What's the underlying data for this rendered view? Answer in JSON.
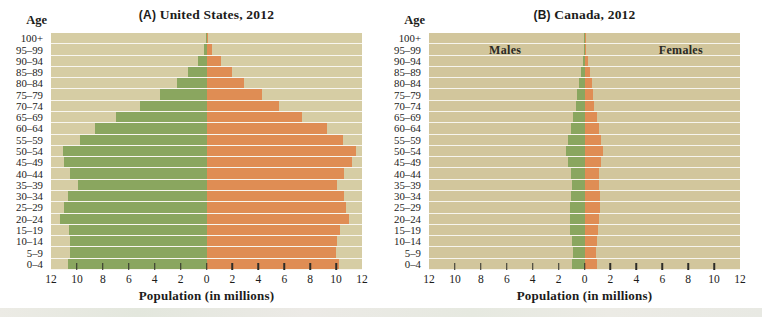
{
  "figure": {
    "age_header": "Age",
    "xlabel": "Population (in millions)",
    "tick_labels": [
      "12",
      "10",
      "8",
      "6",
      "4",
      "2",
      "0",
      "2",
      "4",
      "6",
      "8",
      "10",
      "12"
    ],
    "age_groups_top_to_bottom": [
      "100+",
      "95–99",
      "90–94",
      "85–89",
      "80–84",
      "75–79",
      "70–74",
      "65–69",
      "60–64",
      "55–59",
      "50–54",
      "45–49",
      "40–44",
      "35–39",
      "30–34",
      "25–29",
      "20–24",
      "15–19",
      "10–14",
      "5–9",
      "0–4"
    ],
    "colors": {
      "males_bar": "#8aa65f",
      "females_bar": "#df8d54",
      "panel_a_background": "#d6cda4",
      "panel_b_background": "#d2c69c",
      "gridline": "#f5f2e3",
      "tick": "#2d2d28",
      "text": "#1c1c1a"
    }
  },
  "chart_data": [
    {
      "type": "bar",
      "subtype": "population-pyramid",
      "panel_letter": "(A)",
      "title": "United States, 2012",
      "full_title": "(A) United States, 2012",
      "xlabel": "Population (in millions)",
      "ylabel": "Age",
      "xlim": [
        -12,
        12
      ],
      "x_unit": "millions of people",
      "grid": true,
      "panel_bg": "#d6cda4",
      "categories": [
        "100+",
        "95–99",
        "90–94",
        "85–89",
        "80–84",
        "75–79",
        "70–74",
        "65–69",
        "60–64",
        "55–59",
        "50–54",
        "45–49",
        "40–44",
        "35–39",
        "30–34",
        "25–29",
        "20–24",
        "15–19",
        "10–14",
        "5–9",
        "0–4"
      ],
      "series": [
        {
          "name": "Males",
          "side": "left",
          "color": "#8aa65f",
          "values": [
            0.05,
            0.2,
            0.65,
            1.4,
            2.3,
            3.6,
            5.1,
            7.0,
            8.6,
            9.8,
            11.1,
            11.0,
            10.5,
            9.9,
            10.7,
            11.0,
            11.3,
            10.6,
            10.5,
            10.5,
            10.7
          ]
        },
        {
          "name": "Females",
          "side": "right",
          "color": "#df8d54",
          "values": [
            0.15,
            0.45,
            1.1,
            2.0,
            2.9,
            4.3,
            5.6,
            7.4,
            9.3,
            10.5,
            11.5,
            11.2,
            10.6,
            10.1,
            10.6,
            10.8,
            11.0,
            10.3,
            10.1,
            10.0,
            10.2
          ]
        }
      ],
      "inside_labels": []
    },
    {
      "type": "bar",
      "subtype": "population-pyramid",
      "panel_letter": "(B)",
      "title": "Canada, 2012",
      "full_title": "(B) Canada, 2012",
      "xlabel": "Population (in millions)",
      "ylabel": "Age",
      "xlim": [
        -12,
        12
      ],
      "x_unit": "millions of people",
      "grid": true,
      "panel_bg": "#d2c69c",
      "categories": [
        "100+",
        "95–99",
        "90–94",
        "85–89",
        "80–84",
        "75–79",
        "70–74",
        "65–69",
        "60–64",
        "55–59",
        "50–54",
        "45–49",
        "40–44",
        "35–39",
        "30–34",
        "25–29",
        "20–24",
        "15–19",
        "10–14",
        "5–9",
        "0–4"
      ],
      "series": [
        {
          "name": "Males",
          "side": "left",
          "color": "#8aa65f",
          "values": [
            0.01,
            0.05,
            0.15,
            0.3,
            0.45,
            0.55,
            0.68,
            0.87,
            1.07,
            1.25,
            1.4,
            1.28,
            1.05,
            1.0,
            1.05,
            1.1,
            1.15,
            1.1,
            0.95,
            0.92,
            0.95
          ]
        },
        {
          "name": "Females",
          "side": "right",
          "color": "#df8d54",
          "values": [
            0.02,
            0.1,
            0.25,
            0.42,
            0.55,
            0.65,
            0.75,
            0.93,
            1.12,
            1.3,
            1.4,
            1.27,
            1.15,
            1.12,
            1.17,
            1.2,
            1.15,
            1.05,
            0.95,
            0.92,
            0.97
          ]
        }
      ],
      "inside_labels": [
        {
          "text": "Males",
          "x_fraction": 0.245
        },
        {
          "text": "Females",
          "x_fraction": 0.81
        }
      ]
    }
  ]
}
